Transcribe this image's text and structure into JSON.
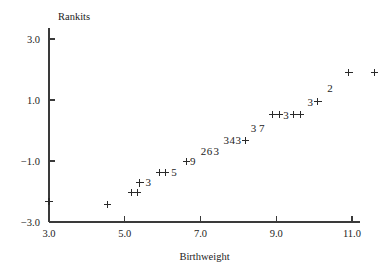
{
  "chart_data": {
    "type": "scatter",
    "title": "",
    "xlabel": "Birthweight",
    "ylabel": "Rankits",
    "xlim": [
      3.0,
      11.0
    ],
    "ylim": [
      -3.0,
      3.0
    ],
    "grid": false,
    "legend": null,
    "xticks": [
      "3.0",
      "5.0",
      "7.0",
      "9.0",
      "11.0"
    ],
    "xtick_values": [
      3.0,
      5.0,
      7.0,
      9.0,
      11.0
    ],
    "yticks": [
      "3.0",
      "1.0",
      "-1.0",
      "-3.0"
    ],
    "ytick_values": [
      3.0,
      1.0,
      -1.0,
      -3.0
    ],
    "marker": "+",
    "note": "Normal probability plot; digits denote number of overplotted observations at that location",
    "points": [
      {
        "label": "+",
        "x": 3.0,
        "y": -2.32
      },
      {
        "label": "+",
        "x": 4.55,
        "y": -2.42
      },
      {
        "label": "+",
        "x": 5.18,
        "y": -2.02
      },
      {
        "label": "+",
        "x": 5.34,
        "y": -2.02
      },
      {
        "label": "+",
        "x": 5.4,
        "y": -1.72
      },
      {
        "label": "3",
        "x": 5.62,
        "y": -1.7
      },
      {
        "label": "+",
        "x": 5.92,
        "y": -1.38
      },
      {
        "label": "+",
        "x": 6.08,
        "y": -1.38
      },
      {
        "label": "5",
        "x": 6.3,
        "y": -1.36
      },
      {
        "label": "+",
        "x": 6.62,
        "y": -1.02
      },
      {
        "label": "9",
        "x": 6.8,
        "y": -1.0
      },
      {
        "label": "2",
        "x": 7.08,
        "y": -0.68
      },
      {
        "label": "6",
        "x": 7.24,
        "y": -0.68
      },
      {
        "label": "3",
        "x": 7.42,
        "y": -0.66
      },
      {
        "label": "3",
        "x": 7.68,
        "y": -0.32
      },
      {
        "label": "4",
        "x": 7.84,
        "y": -0.32
      },
      {
        "label": "3",
        "x": 8.0,
        "y": -0.32
      },
      {
        "label": "+",
        "x": 8.18,
        "y": -0.32
      },
      {
        "label": "3",
        "x": 8.4,
        "y": 0.08
      },
      {
        "label": "7",
        "x": 8.62,
        "y": 0.08
      },
      {
        "label": "+",
        "x": 8.9,
        "y": 0.52
      },
      {
        "label": "+",
        "x": 9.08,
        "y": 0.52
      },
      {
        "label": "3",
        "x": 9.26,
        "y": 0.52
      },
      {
        "label": "+",
        "x": 9.46,
        "y": 0.52
      },
      {
        "label": "+",
        "x": 9.64,
        "y": 0.52
      },
      {
        "label": "3",
        "x": 9.9,
        "y": 0.94
      },
      {
        "label": "+",
        "x": 10.1,
        "y": 0.94
      },
      {
        "label": "2",
        "x": 10.42,
        "y": 1.4
      },
      {
        "label": "+",
        "x": 10.92,
        "y": 1.9
      },
      {
        "label": "+",
        "x": 11.6,
        "y": 1.9
      }
    ]
  }
}
